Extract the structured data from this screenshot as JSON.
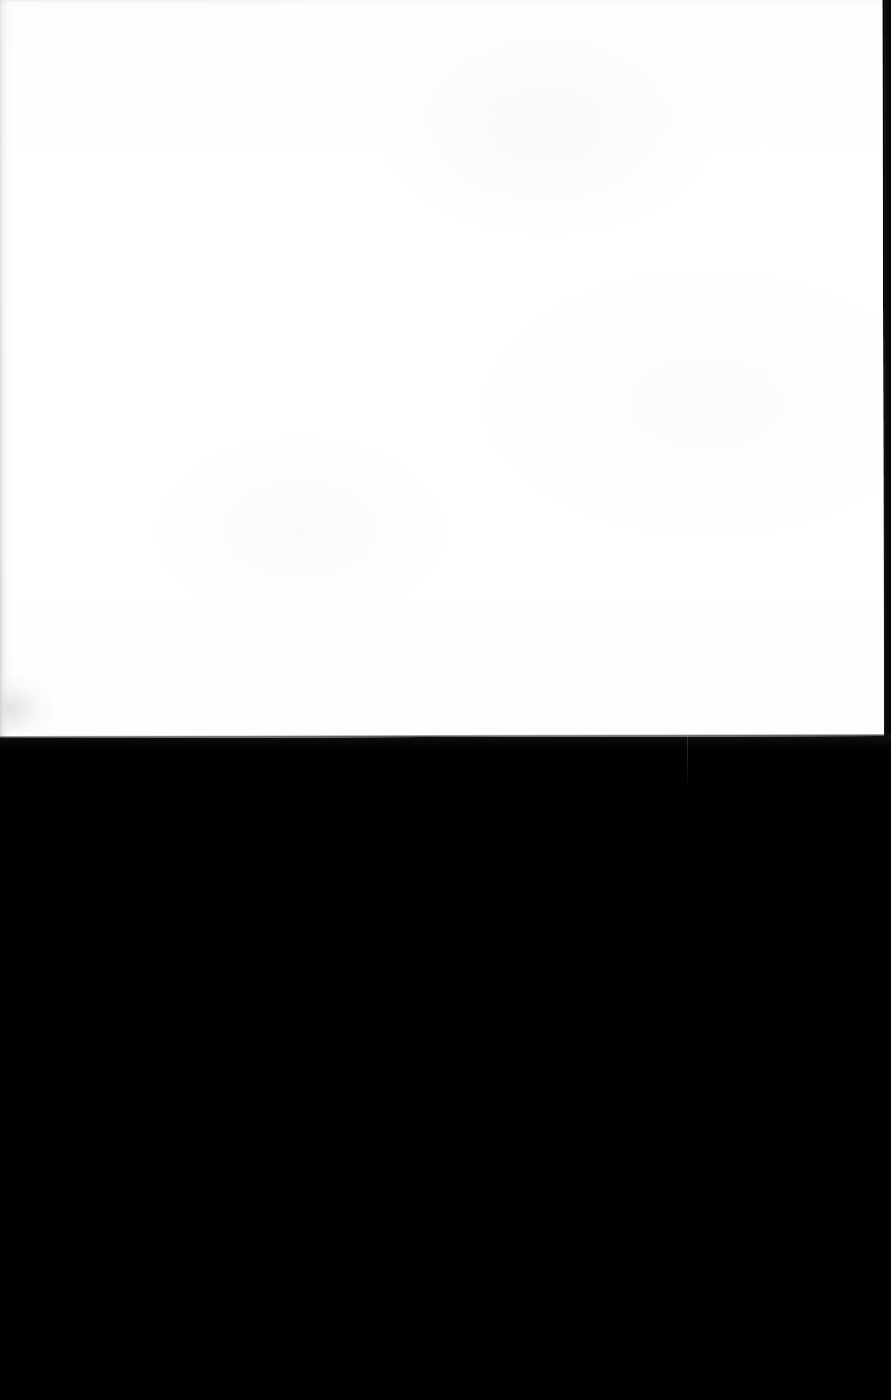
{
  "document": {
    "kind": "scanned-page",
    "page_content_text": "",
    "is_blank": true,
    "orientation": "portrait"
  },
  "canvas": {
    "width_px": 891,
    "height_px": 1400
  },
  "page": {
    "label": "blank-scanned-page",
    "left_px": 0,
    "top_px": 0,
    "width_px": 884,
    "bottom_edge_px": 733,
    "tilt_degrees": -0.13,
    "paper_color": "#FEFEFF",
    "edge_shadow_color": "#B0B0B4"
  },
  "background": {
    "label": "scanner-backing",
    "color": "#000000",
    "top_px": 733,
    "height_px": 667
  },
  "artifacts": {
    "left_margin_shadow": {
      "label": "left-edge-scan-shadow",
      "x_px": 0,
      "width_px": 16
    },
    "top_margin_shadow": {
      "label": "top-edge-scan-shadow",
      "y_px": 0,
      "height_px": 9
    },
    "corner_smudge": {
      "label": "lower-left-corner-smudge",
      "x_px": 0,
      "y_px": 676
    },
    "right_dark_strip": {
      "label": "right-frame-dark-strip",
      "x_px": 884,
      "width_px": 7,
      "color": "#0A0A0B"
    },
    "void_streak": {
      "label": "vertical-scan-streak",
      "x_px": 687,
      "y_start_px": 735,
      "y_end_px": 791,
      "color": "#3A3A3E"
    }
  }
}
